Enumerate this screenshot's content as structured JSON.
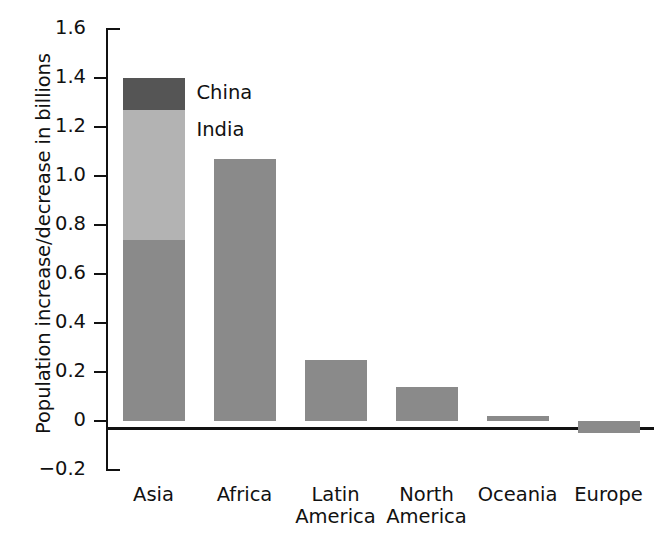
{
  "chart_data": {
    "type": "bar",
    "title": "",
    "xlabel": "",
    "ylabel": "Population increase/decrease in billions",
    "ylim": [
      -0.2,
      1.6
    ],
    "ytick_labels": [
      "1.6",
      "1.4",
      "1.2",
      "1.0",
      "0.8",
      "0.6",
      "0.4",
      "0.2",
      "0",
      "−0.2"
    ],
    "ytick_values": [
      1.6,
      1.4,
      1.2,
      1.0,
      0.8,
      0.6,
      0.4,
      0.2,
      0,
      -0.2
    ],
    "grid": false,
    "legend_position": "inline-annotation",
    "stacked": true,
    "categories": [
      "Asia",
      "Africa",
      "Latin America",
      "North America",
      "Oceania",
      "Europe"
    ],
    "category_lines": [
      [
        "Asia"
      ],
      [
        "Africa"
      ],
      [
        "Latin",
        "America"
      ],
      [
        "North",
        "America"
      ],
      [
        "Oceania"
      ],
      [
        "Europe"
      ]
    ],
    "series": [
      {
        "name": "Rest of region",
        "values": [
          0.74,
          1.07,
          0.25,
          0.14,
          0.02,
          -0.05
        ],
        "color": "#8a8a8a"
      },
      {
        "name": "India",
        "values": [
          0.53,
          0,
          0,
          0,
          0,
          0
        ],
        "color": "#b3b3b3"
      },
      {
        "name": "China",
        "values": [
          0.13,
          0,
          0,
          0,
          0,
          0
        ],
        "color": "#555555"
      }
    ],
    "totals": [
      1.4,
      1.07,
      0.25,
      0.14,
      0.02,
      -0.05
    ],
    "annotations": [
      {
        "text": "China",
        "series": "China",
        "value": 1.335
      },
      {
        "text": "India",
        "series": "India",
        "value": 1.185
      }
    ]
  },
  "colors": {
    "base": "#8a8a8a",
    "india": "#b3b3b3",
    "china": "#555555",
    "axis": "#111111",
    "background": "#ffffff"
  }
}
